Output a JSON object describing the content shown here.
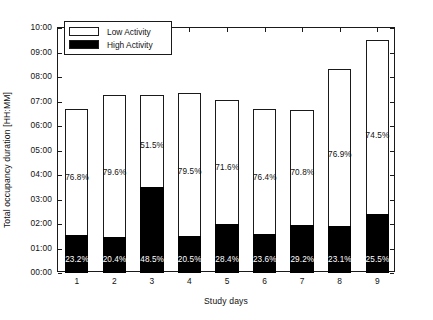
{
  "chart_data": {
    "type": "bar",
    "subtype": "stacked-bar-100-percent-annotated",
    "title": "",
    "xlabel": "Study days",
    "ylabel": "Total occupancy duration [HH:MM]",
    "categories": [
      "1",
      "2",
      "3",
      "4",
      "5",
      "6",
      "7",
      "8",
      "9"
    ],
    "ytick_labels": [
      "00:00",
      "01:00",
      "02:00",
      "03:00",
      "04:00",
      "05:00",
      "06:00",
      "07:00",
      "08:00",
      "09:00",
      "10:00"
    ],
    "ytick_values": [
      0,
      1,
      2,
      3,
      4,
      5,
      6,
      7,
      8,
      9,
      10
    ],
    "ylim": [
      0,
      10
    ],
    "grid": false,
    "legend_position": "upper-left-inside",
    "series": [
      {
        "name": "Low Activity",
        "color": "#ffffff",
        "edge_color": "#1a1a1a",
        "values": [
          5.15,
          5.77,
          3.74,
          5.83,
          5.07,
          5.13,
          4.72,
          6.41,
          7.08
        ],
        "value_labels": [
          "76.8%",
          "79.6%",
          "51.5%",
          "79.5%",
          "71.6%",
          "76.4%",
          "70.8%",
          "76.9%",
          "74.5%"
        ],
        "percentages": [
          76.8,
          79.6,
          51.5,
          79.5,
          71.6,
          76.4,
          70.8,
          76.9,
          74.5
        ]
      },
      {
        "name": "High Activity",
        "color": "#000000",
        "edge_color": "#000000",
        "values": [
          1.55,
          1.48,
          3.52,
          1.5,
          2.01,
          1.58,
          1.95,
          1.93,
          2.42
        ],
        "value_labels": [
          "23.2%",
          "20.4%",
          "48.5%",
          "20.5%",
          "28.4%",
          "23.6%",
          "29.2%",
          "23.1%",
          "25.5%"
        ],
        "percentages": [
          23.2,
          20.4,
          48.5,
          20.5,
          28.4,
          23.6,
          29.2,
          23.1,
          25.5
        ]
      }
    ],
    "totals": [
      6.7,
      7.25,
      7.26,
      7.33,
      7.08,
      6.71,
      6.67,
      8.34,
      9.5
    ],
    "total_labels": [
      "06:42",
      "07:15",
      "07:16",
      "07:20",
      "07:05",
      "06:43",
      "06:40",
      "08:20",
      "09:30"
    ]
  },
  "legend": {
    "entries": [
      {
        "label": "Low Activity",
        "swatch": "white-swatch"
      },
      {
        "label": "High Activity",
        "swatch": "black-swatch"
      }
    ]
  }
}
